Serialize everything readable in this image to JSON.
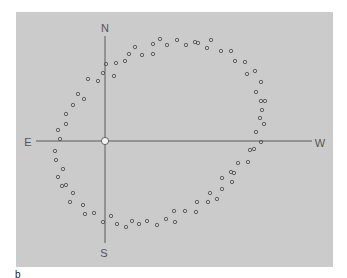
{
  "figure": {
    "panel_label": "b",
    "background_color": "#cbcbcb",
    "axis_color": "#5a5a5a",
    "dot_color": "#555555",
    "origin_fill": "#f2f2f2"
  },
  "compass": {
    "north": "N",
    "south": "S",
    "east": "E",
    "west": "W",
    "origin": [
      105,
      141
    ]
  },
  "chart_data": {
    "type": "scatter",
    "title": "",
    "xlabel": "",
    "ylabel": "",
    "grid": false,
    "axis_labels": {
      "top": "N",
      "bottom": "S",
      "left": "E",
      "right": "W"
    },
    "coordinate_system": "image pixels, origin marker at (105,141)",
    "points": [
      [
        106,
        64
      ],
      [
        116,
        63
      ],
      [
        125,
        61
      ],
      [
        129,
        54
      ],
      [
        135,
        47
      ],
      [
        142,
        55
      ],
      [
        153,
        44
      ],
      [
        153,
        54
      ],
      [
        160,
        39
      ],
      [
        167,
        45
      ],
      [
        177,
        40
      ],
      [
        186,
        45
      ],
      [
        195,
        42
      ],
      [
        198,
        43
      ],
      [
        207,
        48
      ],
      [
        211,
        40
      ],
      [
        221,
        51
      ],
      [
        231,
        51
      ],
      [
        235,
        61
      ],
      [
        245,
        62
      ],
      [
        247,
        74
      ],
      [
        255,
        71
      ],
      [
        103,
        73
      ],
      [
        114,
        76
      ],
      [
        98,
        81
      ],
      [
        88,
        79
      ],
      [
        261,
        82
      ],
      [
        256,
        92
      ],
      [
        261,
        101
      ],
      [
        265,
        101
      ],
      [
        262,
        110
      ],
      [
        260,
        118
      ],
      [
        264,
        124
      ],
      [
        256,
        132
      ],
      [
        261,
        142
      ],
      [
        250,
        150
      ],
      [
        254,
        149
      ],
      [
        238,
        163
      ],
      [
        248,
        162
      ],
      [
        231,
        172
      ],
      [
        234,
        173
      ],
      [
        222,
        178
      ],
      [
        232,
        182
      ],
      [
        222,
        189
      ],
      [
        210,
        193
      ],
      [
        217,
        199
      ],
      [
        208,
        202
      ],
      [
        197,
        202
      ],
      [
        185,
        211
      ],
      [
        196,
        212
      ],
      [
        175,
        222
      ],
      [
        174,
        211
      ],
      [
        166,
        219
      ],
      [
        157,
        225
      ],
      [
        147,
        221
      ],
      [
        139,
        224
      ],
      [
        132,
        221
      ],
      [
        126,
        227
      ],
      [
        117,
        224
      ],
      [
        111,
        216
      ],
      [
        103,
        222
      ],
      [
        94,
        213
      ],
      [
        85,
        214
      ],
      [
        83,
        205
      ],
      [
        73,
        193
      ],
      [
        70,
        202
      ],
      [
        62,
        186
      ],
      [
        66,
        185
      ],
      [
        58,
        177
      ],
      [
        63,
        169
      ],
      [
        56,
        160
      ],
      [
        55,
        151
      ],
      [
        60,
        139
      ],
      [
        58,
        130
      ],
      [
        66,
        124
      ],
      [
        66,
        114
      ],
      [
        73,
        105
      ],
      [
        78,
        94
      ],
      [
        84,
        99
      ]
    ]
  }
}
